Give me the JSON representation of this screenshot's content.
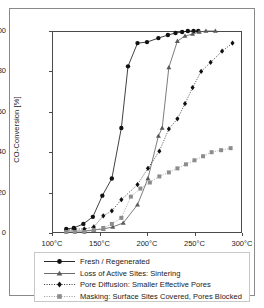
{
  "chart_data": {
    "type": "line",
    "title": "",
    "xlabel": "",
    "ylabel": "CO-Conversion [%]",
    "xlim": [
      100,
      300
    ],
    "ylim": [
      0,
      100
    ],
    "xticks": [
      "100°C",
      "150°C",
      "200°C",
      "250°C",
      "300°C"
    ],
    "xtick_values": [
      100,
      150,
      200,
      250,
      300
    ],
    "yticks": [
      "0",
      "20",
      "40",
      "60",
      "80",
      "100"
    ],
    "ytick_values": [
      0,
      20,
      40,
      60,
      80,
      100
    ],
    "grid": false,
    "legend_position": "below-axes",
    "series": [
      {
        "name": "Fresh / Regenerated",
        "marker": "circle",
        "linestyle": "solid",
        "color": "#111111",
        "x": [
          115,
          123,
          133,
          143,
          153,
          163,
          173,
          180,
          190,
          200,
          212,
          222,
          230,
          237,
          243,
          249,
          254
        ],
        "y": [
          2.0,
          2.5,
          4.5,
          8.0,
          18.5,
          27.0,
          52.0,
          82.5,
          94.0,
          94.5,
          96.5,
          98.0,
          99.0,
          99.5,
          100.0,
          100.0,
          100.0
        ]
      },
      {
        "name": "Loss of Active Sites: Sintering",
        "marker": "triangle",
        "linestyle": "solid",
        "color": "#5a5a5a",
        "x": [
          115,
          124,
          134,
          144,
          154,
          164,
          175,
          190,
          201,
          212,
          216,
          223,
          232,
          240,
          248,
          255,
          262,
          272
        ],
        "y": [
          1.0,
          1.0,
          1.0,
          1.5,
          2.0,
          3.0,
          5.0,
          14.0,
          27.0,
          48.0,
          52.0,
          82.0,
          95.0,
          97.5,
          98.5,
          99.5,
          100.0,
          100.0
        ]
      },
      {
        "name": "Pore Diffusion: Smaller Effective Pores",
        "marker": "diamond",
        "linestyle": "dotted",
        "color": "#111111",
        "x": [
          115,
          124,
          134,
          144,
          154,
          163,
          173,
          190,
          201,
          213,
          223,
          232,
          240,
          248,
          257,
          267,
          279,
          290
        ],
        "y": [
          1.5,
          2.0,
          2.0,
          3.0,
          8.5,
          11.0,
          16.5,
          24.0,
          32.0,
          40.5,
          51.5,
          56.5,
          64.0,
          72.0,
          80.0,
          84.5,
          90.0,
          94.0
        ]
      },
      {
        "name": "Masking: Surface Sites Covered, Pores Blocked",
        "marker": "square",
        "linestyle": "dotted",
        "color": "#8c8c8c",
        "x": [
          115,
          124,
          134,
          144,
          154,
          163,
          173,
          183,
          193,
          203,
          213,
          223,
          232,
          241,
          250,
          259,
          268,
          278,
          288
        ],
        "y": [
          0.5,
          0.5,
          0.5,
          1.5,
          2.5,
          4.5,
          7.5,
          18.0,
          22.0,
          25.0,
          28.0,
          30.0,
          32.0,
          34.0,
          36.0,
          38.0,
          40.0,
          41.0,
          42.0
        ]
      }
    ]
  },
  "figure": {
    "y_axis_title": "CO-Conversion [%]"
  },
  "legend": {
    "items": [
      {
        "label": "Fresh / Regenerated"
      },
      {
        "label": "Loss of Active Sites: Sintering"
      },
      {
        "label": "Pore Diffusion: Smaller Effective Pores"
      },
      {
        "label": "Masking: Surface Sites Covered, Pores Blocked"
      }
    ]
  }
}
